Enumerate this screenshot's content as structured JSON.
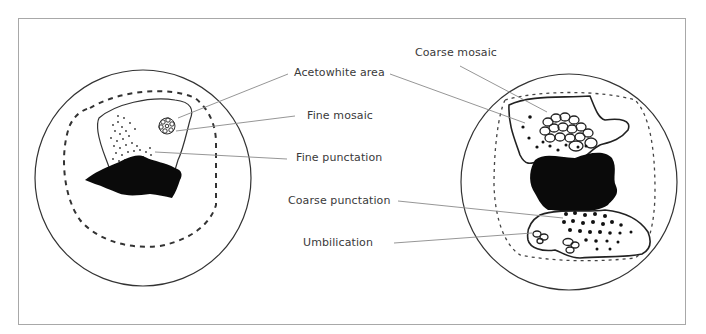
{
  "figure": {
    "left_panel": {
      "description": "Cervix with minor-grade lesion",
      "labels": []
    },
    "labels": [
      {
        "id": "acetowhite",
        "text": "Acetowhite area"
      },
      {
        "id": "fine_mosaic",
        "text": "Fine mosaic"
      },
      {
        "id": "fine_punctation",
        "text": "Fine punctation"
      },
      {
        "id": "coarse_mosaic",
        "text": "Coarse mosaic"
      },
      {
        "id": "coarse_punctation",
        "text": "Coarse punctation"
      },
      {
        "id": "umbilication",
        "text": "Umbilication"
      }
    ],
    "colors": {
      "frame": "#a8a8a8",
      "outline": "#222222",
      "leader": "#8a8a8a",
      "lesion_fill": "#0a0a0a",
      "text": "#3a3a3a"
    }
  }
}
